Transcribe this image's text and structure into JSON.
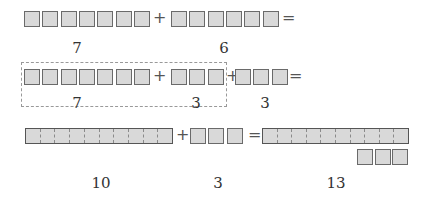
{
  "rows": [
    {
      "name": "row-1",
      "left_count": 7,
      "right_count": 6,
      "operator": "+",
      "equals": "=",
      "labels": [
        "7",
        "6"
      ]
    },
    {
      "name": "row-2",
      "left_count": 7,
      "middle_count": 3,
      "right_count": 3,
      "operator": "+",
      "equals": "=",
      "labels": [
        "7",
        "3",
        "3"
      ],
      "grouping": "7 + 3 grouped in dashed box"
    },
    {
      "name": "row-3",
      "ten_bar_segments": 10,
      "add_count": 3,
      "result_bar_segments": 10,
      "result_extra_count": 3,
      "operator": "+",
      "equals": "=",
      "labels": [
        "10",
        "3",
        "13"
      ]
    }
  ],
  "colors": {
    "box_fill": "#d9d9d9",
    "box_border": "#6a6a6a",
    "dashed_frame": "#999999",
    "text": "#333333"
  }
}
